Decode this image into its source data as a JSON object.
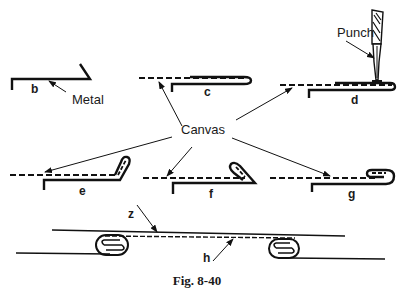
{
  "figure": {
    "caption": "Fig. 8-40",
    "labels": {
      "metal": "Metal",
      "canvas": "Canvas",
      "punch": "Punch"
    },
    "steps": [
      {
        "id": "b",
        "label": "b"
      },
      {
        "id": "c",
        "label": "c"
      },
      {
        "id": "d",
        "label": "d"
      },
      {
        "id": "e",
        "label": "e"
      },
      {
        "id": "f",
        "label": "f"
      },
      {
        "id": "g",
        "label": "g"
      },
      {
        "id": "h",
        "label": "h"
      }
    ],
    "z_label": "z",
    "colors": {
      "ink": "#111111",
      "background": "#ffffff"
    }
  }
}
